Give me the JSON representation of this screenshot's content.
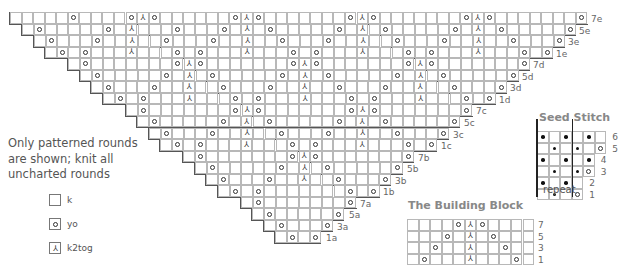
{
  "main_chart": {
    "origin": {
      "x": 9,
      "y": 12
    },
    "cell": 11.55,
    "rows": [
      {
        "label": "7e",
        "left": 9,
        "right": 586,
        "symbols": [
          {
            "x": 70,
            "s": "yo"
          },
          {
            "x": 351,
            "s": "yo"
          },
          {
            "x": 128,
            "s": "yo"
          },
          {
            "x": 139,
            "s": "ssk"
          },
          {
            "x": 151,
            "s": "yo"
          },
          {
            "x": 231,
            "s": "yo"
          },
          {
            "x": 243,
            "s": "ssk"
          },
          {
            "x": 254,
            "s": "yo"
          },
          {
            "x": 254,
            "s": ""
          },
          {
            "x": 358,
            "s": ""
          },
          {
            "x": 463,
            "s": "yo"
          },
          {
            "x": 474,
            "s": "ssk"
          },
          {
            "x": 485,
            "s": "yo"
          },
          {
            "x": 579,
            "s": "yo"
          },
          {
            "x": 363,
            "s": "ssk"
          },
          {
            "x": 374,
            "s": "yo"
          }
        ]
      },
      {
        "label": "5e",
        "left": 21,
        "right": 574,
        "symbols": [
          {
            "x": 37,
            "s": "yo"
          },
          {
            "x": 106,
            "s": "yo"
          },
          {
            "x": 128,
            "s": "ssk"
          },
          {
            "x": 173,
            "s": "yo"
          },
          {
            "x": 220,
            "s": "yo"
          },
          {
            "x": 243,
            "s": "ssk"
          },
          {
            "x": 266,
            "s": "yo"
          },
          {
            "x": 336,
            "s": "yo"
          },
          {
            "x": 358,
            "s": "ssk"
          },
          {
            "x": 382,
            "s": "yo"
          },
          {
            "x": 451,
            "s": "yo"
          },
          {
            "x": 474,
            "s": "ssk"
          },
          {
            "x": 498,
            "s": "yo"
          },
          {
            "x": 567,
            "s": "yo"
          }
        ]
      },
      {
        "label": "3e",
        "left": 33,
        "right": 563,
        "symbols": [
          {
            "x": 49,
            "s": "yo"
          },
          {
            "x": 95,
            "s": "yo"
          },
          {
            "x": 128,
            "s": "ssk"
          },
          {
            "x": 162,
            "s": "yo"
          },
          {
            "x": 209,
            "s": "yo"
          },
          {
            "x": 243,
            "s": "ssk"
          },
          {
            "x": 278,
            "s": "yo"
          },
          {
            "x": 324,
            "s": "yo"
          },
          {
            "x": 358,
            "s": "ssk"
          },
          {
            "x": 393,
            "s": "yo"
          },
          {
            "x": 440,
            "s": "yo"
          },
          {
            "x": 474,
            "s": "ssk"
          },
          {
            "x": 509,
            "s": "yo"
          },
          {
            "x": 556,
            "s": "yo"
          }
        ]
      },
      {
        "label": "1e",
        "left": 44,
        "right": 551,
        "symbols": [
          {
            "x": 60,
            "s": "yo"
          },
          {
            "x": 83,
            "s": "yo"
          },
          {
            "x": 128,
            "s": "k2tog"
          },
          {
            "x": 174,
            "s": "yo"
          },
          {
            "x": 197,
            "s": "yo"
          },
          {
            "x": 243,
            "s": "ssk"
          },
          {
            "x": 289,
            "s": "yo"
          },
          {
            "x": 312,
            "s": "yo"
          },
          {
            "x": 358,
            "s": "ssk"
          },
          {
            "x": 405,
            "s": "yo"
          },
          {
            "x": 428,
            "s": "yo"
          },
          {
            "x": 474,
            "s": "ssk"
          },
          {
            "x": 520,
            "s": "yo"
          },
          {
            "x": 544,
            "s": "yo"
          }
        ]
      },
      {
        "label": "7d",
        "left": 67,
        "right": 528,
        "symbols": [
          {
            "x": 83,
            "s": "yo"
          },
          {
            "x": 174,
            "s": "yo"
          },
          {
            "x": 186,
            "s": "ssk"
          },
          {
            "x": 197,
            "s": "yo"
          },
          {
            "x": 289,
            "s": "yo"
          },
          {
            "x": 301,
            "s": "ssk"
          },
          {
            "x": 312,
            "s": "yo"
          },
          {
            "x": 405,
            "s": "yo"
          },
          {
            "x": 417,
            "s": "ssk"
          },
          {
            "x": 428,
            "s": "yo"
          },
          {
            "x": 521,
            "s": "yo"
          }
        ]
      },
      {
        "label": "5d",
        "left": 79,
        "right": 517,
        "symbols": [
          {
            "x": 95,
            "s": "yo"
          },
          {
            "x": 162,
            "s": "yo"
          },
          {
            "x": 186,
            "s": "ssk"
          },
          {
            "x": 209,
            "s": "yo"
          },
          {
            "x": 278,
            "s": "yo"
          },
          {
            "x": 301,
            "s": "ssk"
          },
          {
            "x": 324,
            "s": "yo"
          },
          {
            "x": 393,
            "s": "yo"
          },
          {
            "x": 417,
            "s": "ssk"
          },
          {
            "x": 440,
            "s": "yo"
          },
          {
            "x": 509,
            "s": "yo"
          }
        ]
      },
      {
        "label": "3d",
        "left": 90,
        "right": 505,
        "symbols": [
          {
            "x": 106,
            "s": "yo"
          },
          {
            "x": 151,
            "s": "yo"
          },
          {
            "x": 186,
            "s": "ssk"
          },
          {
            "x": 220,
            "s": "yo"
          },
          {
            "x": 266,
            "s": "yo"
          },
          {
            "x": 301,
            "s": "ssk"
          },
          {
            "x": 336,
            "s": "yo"
          },
          {
            "x": 382,
            "s": "yo"
          },
          {
            "x": 417,
            "s": "ssk"
          },
          {
            "x": 451,
            "s": "yo"
          },
          {
            "x": 498,
            "s": "yo"
          }
        ]
      },
      {
        "label": "1d",
        "left": 102,
        "right": 494,
        "symbols": [
          {
            "x": 118,
            "s": "yo"
          },
          {
            "x": 139,
            "s": "yo"
          },
          {
            "x": 186,
            "s": "k2tog"
          },
          {
            "x": 231,
            "s": "yo"
          },
          {
            "x": 254,
            "s": "yo"
          },
          {
            "x": 301,
            "s": "ssk"
          },
          {
            "x": 347,
            "s": "yo"
          },
          {
            "x": 370,
            "s": "yo"
          },
          {
            "x": 417,
            "s": "ssk"
          },
          {
            "x": 463,
            "s": "yo"
          },
          {
            "x": 486,
            "s": "yo"
          }
        ]
      },
      {
        "label": "7c",
        "left": 125,
        "right": 471,
        "symbols": [
          {
            "x": 139,
            "s": "yo"
          },
          {
            "x": 231,
            "s": "yo"
          },
          {
            "x": 243,
            "s": "ssk"
          },
          {
            "x": 254,
            "s": "yo"
          },
          {
            "x": 347,
            "s": "yo"
          },
          {
            "x": 358,
            "s": "ssk"
          },
          {
            "x": 370,
            "s": "yo"
          },
          {
            "x": 463,
            "s": "yo"
          }
        ]
      },
      {
        "label": "5c",
        "left": 136,
        "right": 459,
        "symbols": [
          {
            "x": 151,
            "s": "yo"
          },
          {
            "x": 220,
            "s": "yo"
          },
          {
            "x": 243,
            "s": "ssk"
          },
          {
            "x": 266,
            "s": "yo"
          },
          {
            "x": 336,
            "s": "yo"
          },
          {
            "x": 358,
            "s": "ssk"
          },
          {
            "x": 382,
            "s": "yo"
          },
          {
            "x": 451,
            "s": "yo"
          }
        ]
      },
      {
        "label": "3c",
        "left": 148,
        "right": 448,
        "symbols": [
          {
            "x": 162,
            "s": "yo"
          },
          {
            "x": 209,
            "s": "yo"
          },
          {
            "x": 243,
            "s": "ssk"
          },
          {
            "x": 278,
            "s": "yo"
          },
          {
            "x": 324,
            "s": "yo"
          },
          {
            "x": 358,
            "s": "ssk"
          },
          {
            "x": 393,
            "s": "yo"
          },
          {
            "x": 440,
            "s": "yo"
          }
        ]
      },
      {
        "label": "1c",
        "left": 159,
        "right": 436,
        "symbols": [
          {
            "x": 174,
            "s": "yo"
          },
          {
            "x": 197,
            "s": "yo"
          },
          {
            "x": 243,
            "s": "k2tog"
          },
          {
            "x": 289,
            "s": "yo"
          },
          {
            "x": 312,
            "s": "yo"
          },
          {
            "x": 358,
            "s": "ssk"
          },
          {
            "x": 405,
            "s": "yo"
          },
          {
            "x": 428,
            "s": "yo"
          }
        ]
      },
      {
        "label": "7b",
        "left": 182,
        "right": 413,
        "symbols": [
          {
            "x": 197,
            "s": "yo"
          },
          {
            "x": 289,
            "s": "yo"
          },
          {
            "x": 301,
            "s": "ssk"
          },
          {
            "x": 312,
            "s": "yo"
          },
          {
            "x": 405,
            "s": "yo"
          }
        ]
      },
      {
        "label": "5b",
        "left": 194,
        "right": 402,
        "symbols": [
          {
            "x": 209,
            "s": "yo"
          },
          {
            "x": 278,
            "s": "yo"
          },
          {
            "x": 301,
            "s": "ssk"
          },
          {
            "x": 324,
            "s": "yo"
          },
          {
            "x": 393,
            "s": "yo"
          }
        ]
      },
      {
        "label": "3b",
        "left": 205,
        "right": 390,
        "symbols": [
          {
            "x": 220,
            "s": "yo"
          },
          {
            "x": 266,
            "s": "yo"
          },
          {
            "x": 301,
            "s": "ssk"
          },
          {
            "x": 336,
            "s": "yo"
          },
          {
            "x": 382,
            "s": "yo"
          }
        ]
      },
      {
        "label": "1b",
        "left": 217,
        "right": 378,
        "symbols": [
          {
            "x": 231,
            "s": "yo"
          },
          {
            "x": 254,
            "s": "yo"
          },
          {
            "x": 347,
            "s": "yo"
          },
          {
            "x": 370,
            "s": "yo"
          }
        ]
      },
      {
        "label": "7a",
        "left": 240,
        "right": 355,
        "symbols": [
          {
            "x": 254,
            "s": "yo"
          },
          {
            "x": 347,
            "s": "yo"
          }
        ]
      },
      {
        "label": "5a",
        "left": 251,
        "right": 344,
        "symbols": [
          {
            "x": 266,
            "s": "yo"
          },
          {
            "x": 336,
            "s": "yo"
          }
        ]
      },
      {
        "label": "3a",
        "left": 263,
        "right": 332,
        "symbols": [
          {
            "x": 278,
            "s": "yo"
          },
          {
            "x": 324,
            "s": "yo"
          }
        ]
      },
      {
        "label": "1a",
        "left": 274,
        "right": 321,
        "symbols": [
          {
            "x": 289,
            "s": "yo"
          },
          {
            "x": 313,
            "s": "yo"
          }
        ]
      }
    ]
  },
  "note": {
    "lines": [
      "Only patterned rounds",
      "are shown; knit all",
      "uncharted rounds"
    ]
  },
  "legend": {
    "items": [
      {
        "key": "k",
        "label": "k",
        "symbol": ""
      },
      {
        "key": "yo",
        "label": "yo",
        "symbol": "yo"
      },
      {
        "key": "k2tog",
        "label": "k2tog",
        "symbol": "k2tog"
      },
      {
        "key": "ssk",
        "label": "ssk",
        "symbol": "ssk"
      }
    ]
  },
  "seed_stitch": {
    "title": "Seed Stitch",
    "repeat_label": "repeat",
    "rows": [
      {
        "label": "6",
        "cells": [
          "dot",
          "",
          "dot",
          "",
          "dot",
          ""
        ]
      },
      {
        "label": "5",
        "cells": [
          "",
          "dot",
          "",
          "dot",
          "",
          "yo"
        ]
      },
      {
        "label": "4",
        "cells": [
          "dot",
          "",
          "dot",
          "",
          "dot"
        ]
      },
      {
        "label": "3",
        "cells": [
          "",
          "dot",
          "",
          "dot",
          "yo"
        ]
      },
      {
        "label": "2",
        "cells": [
          "dot",
          "",
          "dot",
          ""
        ]
      },
      {
        "label": "1",
        "cells": [
          "",
          "dot",
          "",
          "yo"
        ]
      }
    ]
  },
  "building_block": {
    "title": "The Building Block",
    "rows": [
      {
        "label": "7",
        "cells": [
          "",
          "",
          "",
          "",
          "yo",
          "ssk",
          "yo",
          "",
          "",
          "",
          ""
        ]
      },
      {
        "label": "5",
        "cells": [
          "",
          "",
          "",
          "yo",
          "",
          "ssk",
          "",
          "yo",
          "",
          "",
          ""
        ]
      },
      {
        "label": "3",
        "cells": [
          "",
          "",
          "yo",
          "",
          "",
          "ssk",
          "",
          "",
          "yo",
          "",
          ""
        ]
      },
      {
        "label": "1",
        "cells": [
          "",
          "yo",
          "",
          "",
          "",
          "ssk",
          "",
          "",
          "",
          "yo",
          ""
        ]
      }
    ]
  },
  "symbols": {
    "ssk": "⅄",
    "k2tog": "⅄"
  }
}
